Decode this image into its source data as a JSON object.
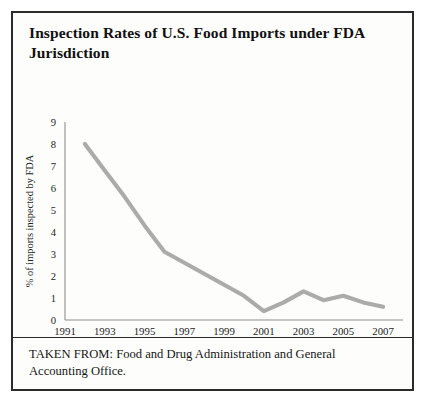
{
  "figure": {
    "title": "Inspection Rates of U.S. Food Imports under FDA Jurisdiction",
    "caption": "TAKEN FROM: Food and Drug Administration and General Accounting Office.",
    "border_color": "#2b2b2b",
    "background_color": "#fdfdfb"
  },
  "chart_data": {
    "type": "line",
    "title": "Inspection Rates of U.S. Food Imports under FDA Jurisdiction",
    "xlabel": "",
    "ylabel": "% of imports inspected by FDA",
    "x": [
      1992,
      1993,
      1994,
      1995,
      1996,
      1997,
      1998,
      1999,
      2000,
      2001,
      2002,
      2003,
      2004,
      2005,
      2006,
      2007
    ],
    "values": [
      8.0,
      6.8,
      5.6,
      4.3,
      3.1,
      2.6,
      2.1,
      1.6,
      1.1,
      0.4,
      0.8,
      1.3,
      0.9,
      1.1,
      0.8,
      0.6
    ],
    "series": [
      {
        "name": "% of imports inspected by FDA",
        "color": "#ababab",
        "values": [
          8.0,
          6.8,
          5.6,
          4.3,
          3.1,
          2.6,
          2.1,
          1.6,
          1.1,
          0.4,
          0.8,
          1.3,
          0.9,
          1.1,
          0.8,
          0.6
        ]
      }
    ],
    "xlim": [
      1991,
      2008
    ],
    "ylim": [
      0,
      9
    ],
    "xticks": [
      1991,
      1993,
      1995,
      1997,
      1999,
      2001,
      2003,
      2005,
      2007
    ],
    "xtick_labels": [
      "1991",
      "1993",
      "1995",
      "1997",
      "1999",
      "2001",
      "2003",
      "2005",
      "2007"
    ],
    "yticks": [
      0,
      1,
      2,
      3,
      4,
      5,
      6,
      7,
      8,
      9
    ],
    "ytick_labels": [
      "0",
      "1",
      "2",
      "3",
      "4",
      "5",
      "6",
      "7",
      "8",
      "9"
    ],
    "grid": false,
    "legend": false,
    "markers": false,
    "line_color": "#ababab",
    "axis_color": "#8e8e8e"
  }
}
